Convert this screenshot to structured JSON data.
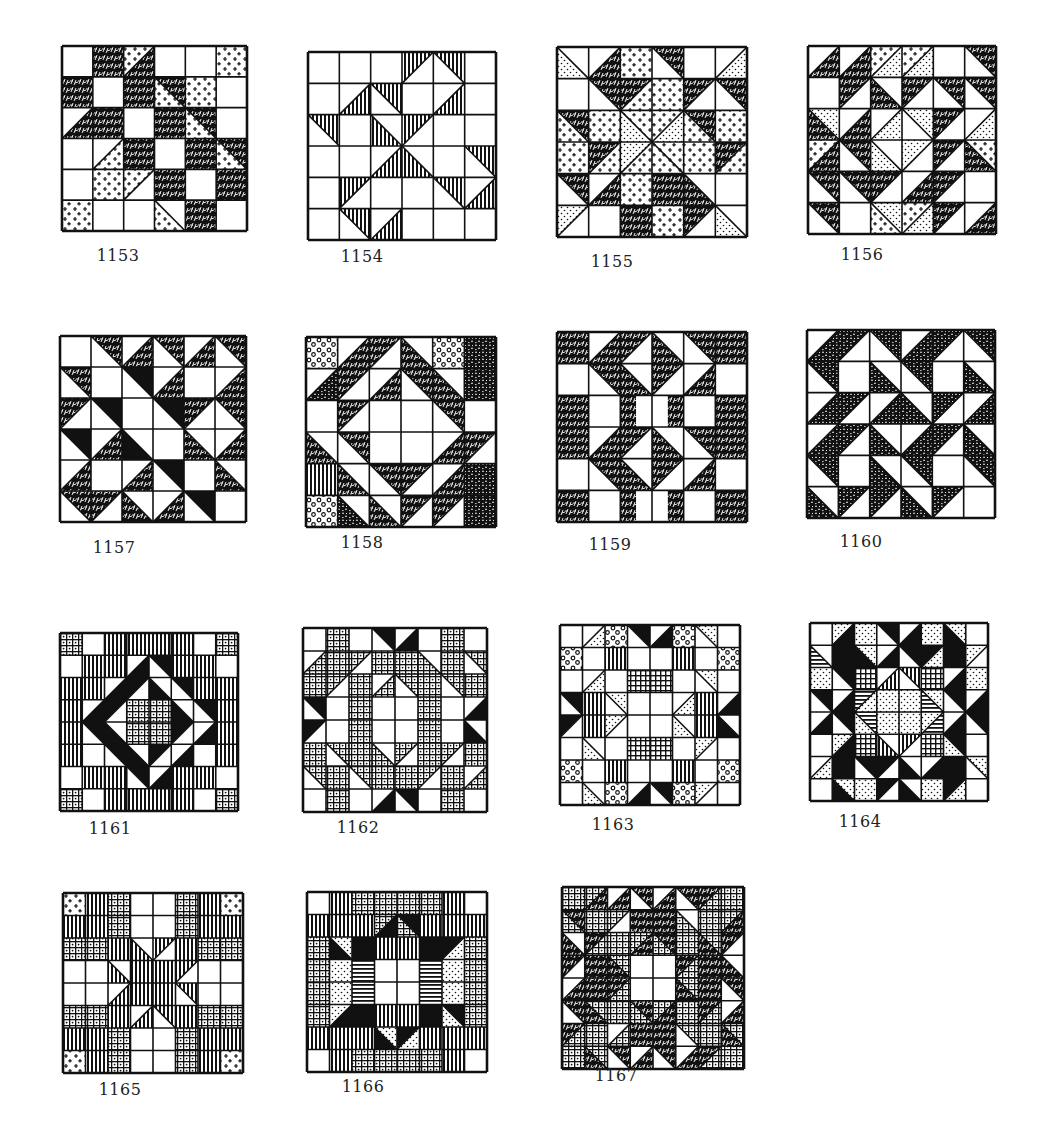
{
  "page": {
    "background": "#ffffff",
    "ink": "#111111"
  },
  "legend": {
    "W": "white",
    "K": "solid-black",
    "S": "scribble-dark-print",
    "C": "crosses-light-print",
    "D": "dots-light-print",
    "V": "vertical-stripes",
    "H": "horizontal-stripes",
    "G": "grid-check-print",
    "R": "dense-dot-grid-print",
    "O": "circles-print",
    "M": "mottled-dark-print"
  },
  "blocks": [
    {
      "id": "1153",
      "label": "1153",
      "x": 62,
      "y": 46,
      "size": 185,
      "n": 6,
      "cells": [
        [
          "W",
          "S",
          "C/S",
          "W",
          "W",
          "C"
        ],
        [
          "S",
          "W",
          "S",
          "S\\C",
          "C",
          "W"
        ],
        [
          "W/S",
          "S",
          "W",
          "S",
          "S\\C",
          "W"
        ],
        [
          "W",
          "W/C",
          "S",
          "W",
          "S",
          "S\\C"
        ],
        [
          "W",
          "C",
          "C/W",
          "S",
          "W",
          "S"
        ],
        [
          "C",
          "W",
          "W",
          "W\\C",
          "S",
          "W"
        ]
      ]
    },
    {
      "id": "1154",
      "label": "1154",
      "x": 308,
      "y": 52,
      "size": 188,
      "n": 6,
      "cells": [
        [
          "W",
          "W",
          "W",
          "V/W",
          "V\\W",
          "W"
        ],
        [
          "W",
          "W/V",
          "V\\W",
          "W",
          "W/V",
          "W"
        ],
        [
          "V\\W",
          "W",
          "W\\V",
          "V/W",
          "W",
          "W"
        ],
        [
          "W",
          "W",
          "W/V",
          "W\\V",
          "W",
          "V\\W"
        ],
        [
          "W",
          "V/W",
          "W",
          "W",
          "V\\W",
          "W/V"
        ],
        [
          "W",
          "V\\W",
          "W/V",
          "W",
          "W",
          "W"
        ]
      ]
    },
    {
      "id": "1155",
      "label": "1155",
      "x": 557,
      "y": 47,
      "size": 190,
      "n": 6,
      "cells": [
        [
          "W\\D",
          "W/S",
          "C",
          "S\\W",
          "W",
          "W/D"
        ],
        [
          "W",
          "S\\W",
          "S/C",
          "C",
          "S/W",
          "S\\W"
        ],
        [
          "S\\C",
          "C",
          "C\\D",
          "C/D",
          "S\\C",
          "C"
        ],
        [
          "C",
          "S/C",
          "D/C",
          "C\\C",
          "C",
          "S/C"
        ],
        [
          "S\\W",
          "W/S",
          "C",
          "S",
          "W\\S",
          "W"
        ],
        [
          "D/W",
          "W",
          "S",
          "C",
          "S/W",
          "W\\D"
        ]
      ]
    },
    {
      "id": "1156",
      "label": "1156",
      "x": 808,
      "y": 46,
      "size": 188,
      "n": 6,
      "cells": [
        [
          "W/S",
          "W/S",
          "C/D",
          "C/D",
          "W",
          "S\\W"
        ],
        [
          "W",
          "S/W",
          "W\\S",
          "S/W",
          "S\\W",
          "S\\W"
        ],
        [
          "D\\S",
          "W/S",
          "W/D",
          "D\\W",
          "S/W",
          "W/D"
        ],
        [
          "C/S",
          "S\\W",
          "W\\D",
          "D/W",
          "S/W",
          "C\\S"
        ],
        [
          "S\\W",
          "S\\W",
          "S/W",
          "W/S",
          "S/W",
          "W"
        ],
        [
          "S\\W",
          "W",
          "D\\C",
          "C/D",
          "S/W",
          "W/S"
        ]
      ]
    },
    {
      "id": "1157",
      "label": "1157",
      "x": 60,
      "y": 336,
      "size": 186,
      "n": 6,
      "cells": [
        [
          "W",
          "S\\W",
          "W/S",
          "S\\W",
          "W/S",
          "S\\W"
        ],
        [
          "S\\W",
          "W",
          "K\\W",
          "W/S",
          "W",
          "W/S"
        ],
        [
          "S/W",
          "K\\W",
          "W",
          "K\\W",
          "S/W",
          "S\\W"
        ],
        [
          "K\\W",
          "W/S",
          "W\\K",
          "W",
          "W\\S",
          "W/S"
        ],
        [
          "W/S",
          "W",
          "W/S",
          "K\\W",
          "W",
          "W\\S"
        ],
        [
          "S\\W",
          "S/W",
          "W\\S",
          "W/S",
          "K\\W",
          "W"
        ]
      ]
    },
    {
      "id": "1158",
      "label": "1158",
      "x": 306,
      "y": 337,
      "size": 190,
      "n": 6,
      "cells": [
        [
          "O",
          "W/S",
          "S/W",
          "W\\S",
          "O",
          "M"
        ],
        [
          "W/M",
          "S/W",
          "W/S",
          "S\\W",
          "W\\S",
          "M"
        ],
        [
          "W",
          "S/W",
          "W",
          "W",
          "S\\W",
          "W"
        ],
        [
          "W\\S",
          "S\\W",
          "W",
          "W",
          "W/S",
          "S/W"
        ],
        [
          "V",
          "W\\S",
          "S\\W",
          "S/W",
          "W/S",
          "M"
        ],
        [
          "O",
          "W\\M",
          "W\\S",
          "S/W",
          "S/W",
          "M"
        ]
      ]
    },
    {
      "id": "1159",
      "label": "1159",
      "x": 557,
      "y": 332,
      "size": 190,
      "n": 6,
      "cells": [
        [
          "S",
          "W/S",
          "S/W",
          "W\\S",
          "S\\W",
          "S"
        ],
        [
          "W",
          "S\\W",
          "W\\S",
          "S/W",
          "W/S",
          "W"
        ],
        [
          "S",
          "W",
          "S|W",
          "W|S",
          "W",
          "S"
        ],
        [
          "S",
          "W/S",
          "S/W",
          "W\\S",
          "S\\W",
          "S"
        ],
        [
          "W",
          "S\\W",
          "W\\S",
          "S/W",
          "W/S",
          "W"
        ],
        [
          "S",
          "W",
          "S|W",
          "W|S",
          "W",
          "S"
        ]
      ]
    },
    {
      "id": "1160",
      "label": "1160",
      "x": 807,
      "y": 330,
      "size": 188,
      "n": 6,
      "cells": [
        [
          "W/M",
          "M/W",
          "M\\W",
          "W/M",
          "M/W",
          "M\\W"
        ],
        [
          "M\\W",
          "W",
          "W\\M",
          "M\\W",
          "W",
          "W\\M"
        ],
        [
          "W/M",
          "M/W",
          "W/M",
          "W\\M",
          "M/W",
          "W/M"
        ],
        [
          "W/M",
          "M/W",
          "W\\M",
          "W/M",
          "M/W",
          "W\\M"
        ],
        [
          "M\\W",
          "W",
          "W\\M",
          "M\\W",
          "W",
          "M\\W"
        ],
        [
          "W\\M",
          "M/W",
          "M/W",
          "W\\M",
          "M/W",
          "W"
        ]
      ]
    },
    {
      "id": "1161",
      "label": "1161",
      "x": 60,
      "y": 633,
      "size": 178,
      "n": 8,
      "cells": [
        [
          "R",
          "W",
          "V",
          "V",
          "V",
          "V",
          "W",
          "R"
        ],
        [
          "W",
          "V",
          "V",
          "W/K",
          "K\\W",
          "V",
          "V",
          "W"
        ],
        [
          "V",
          "V",
          "W/K",
          "K/W",
          "W\\K",
          "K\\W",
          "V",
          "V"
        ],
        [
          "V",
          "W/K",
          "K/W",
          "R",
          "R",
          "W\\K",
          "K\\W",
          "V"
        ],
        [
          "V",
          "K\\W",
          "W\\K",
          "R",
          "R",
          "K/W",
          "W/K",
          "V"
        ],
        [
          "V",
          "W",
          "K\\W",
          "W\\K",
          "K/W",
          "W/K",
          "W",
          "V"
        ],
        [
          "W",
          "V",
          "V",
          "K\\W",
          "W/K",
          "V",
          "V",
          "W"
        ],
        [
          "R",
          "W",
          "V",
          "V",
          "V",
          "V",
          "W",
          "R"
        ]
      ]
    },
    {
      "id": "1162",
      "label": "1162",
      "x": 303,
      "y": 628,
      "size": 184,
      "n": 8,
      "cells": [
        [
          "W",
          "R",
          "W",
          "K\\W",
          "W/K",
          "W",
          "R",
          "W"
        ],
        [
          "W/R",
          "R",
          "R/W",
          "R",
          "R",
          "W\\R",
          "R",
          "R\\W"
        ],
        [
          "R",
          "R/W",
          "R",
          "W/R",
          "R\\W",
          "R",
          "R\\W",
          "R"
        ],
        [
          "K\\W",
          "W",
          "R",
          "W",
          "W",
          "R",
          "W",
          "W/K"
        ],
        [
          "K/W",
          "W",
          "R",
          "W",
          "W",
          "R",
          "W",
          "W\\K"
        ],
        [
          "R",
          "R\\W",
          "R",
          "W\\R",
          "R/W",
          "R",
          "R/W",
          "R"
        ],
        [
          "R\\W",
          "R",
          "R\\W",
          "R",
          "R",
          "R/W",
          "R",
          "W/R"
        ],
        [
          "W",
          "R",
          "W",
          "W/K",
          "K\\W",
          "W",
          "R",
          "W"
        ]
      ]
    },
    {
      "id": "1163",
      "label": "1163",
      "x": 560,
      "y": 625,
      "size": 180,
      "n": 8,
      "cells": [
        [
          "W",
          "W/D",
          "O",
          "K\\W",
          "W/K",
          "O",
          "D\\W",
          "W"
        ],
        [
          "O",
          "W",
          "V",
          "W",
          "W",
          "V",
          "W",
          "O"
        ],
        [
          "W",
          "W/D",
          "W",
          "G",
          "G",
          "W",
          "D\\W",
          "W"
        ],
        [
          "K\\W",
          "V",
          "D\\W",
          "W",
          "W",
          "W/D",
          "V",
          "W/K"
        ],
        [
          "K/W",
          "V",
          "D/W",
          "W",
          "W",
          "W\\D",
          "V",
          "W\\K"
        ],
        [
          "W",
          "W\\D",
          "W",
          "G",
          "G",
          "W",
          "D/W",
          "W"
        ],
        [
          "O",
          "W",
          "V",
          "W",
          "W",
          "V",
          "W",
          "O"
        ],
        [
          "W",
          "W\\D",
          "O",
          "W/K",
          "K\\W",
          "O",
          "D/W",
          "W"
        ]
      ]
    },
    {
      "id": "1164",
      "label": "1164",
      "x": 810,
      "y": 623,
      "size": 178,
      "n": 8,
      "cells": [
        [
          "W",
          "D/K",
          "D",
          "K\\W",
          "W/K",
          "D",
          "D\\K",
          "W"
        ],
        [
          "W\\H",
          "K",
          "D\\K",
          "W/K",
          "K\\W",
          "K/D",
          "K",
          "D/W"
        ],
        [
          "D",
          "K\\W",
          "G",
          "W/V",
          "V\\W",
          "G",
          "W/K",
          "D"
        ],
        [
          "K\\W",
          "W/K",
          "H/D",
          "D",
          "D",
          "D\\H",
          "K\\W",
          "W/K"
        ],
        [
          "W/K",
          "K\\W",
          "H\\D",
          "D",
          "D",
          "D/H",
          "W/K",
          "K\\W"
        ],
        [
          "W",
          "D/K",
          "G",
          "W\\V",
          "V/W",
          "G",
          "K\\D",
          "W"
        ],
        [
          "W/D",
          "K",
          "K\\W",
          "K/W",
          "W\\K",
          "W/K",
          "K",
          "D\\W"
        ],
        [
          "W",
          "D\\K",
          "D",
          "K/W",
          "W\\K",
          "D",
          "K/D",
          "W"
        ]
      ]
    },
    {
      "id": "1165",
      "label": "1165",
      "x": 63,
      "y": 893,
      "size": 180,
      "n": 8,
      "cells": [
        [
          "C",
          "V",
          "R",
          "W",
          "W",
          "R",
          "V",
          "C"
        ],
        [
          "V",
          "V",
          "R",
          "W",
          "W",
          "R",
          "V",
          "V"
        ],
        [
          "R",
          "R",
          "V",
          "W\\V",
          "V/W",
          "V",
          "R",
          "R"
        ],
        [
          "W",
          "W",
          "W\\V",
          "V",
          "V",
          "V/W",
          "W",
          "W"
        ],
        [
          "W",
          "W",
          "W/V",
          "V",
          "V",
          "V\\W",
          "W",
          "W"
        ],
        [
          "R",
          "R",
          "V",
          "W/V",
          "V\\W",
          "V",
          "R",
          "R"
        ],
        [
          "V",
          "V",
          "R",
          "W",
          "W",
          "R",
          "V",
          "V"
        ],
        [
          "C",
          "V",
          "R",
          "W",
          "W",
          "R",
          "V",
          "C"
        ]
      ]
    },
    {
      "id": "1166",
      "label": "1166",
      "x": 307,
      "y": 892,
      "size": 180,
      "n": 8,
      "cells": [
        [
          "W",
          "V",
          "R",
          "R",
          "R",
          "R",
          "V",
          "W"
        ],
        [
          "V",
          "V",
          "V",
          "R/K",
          "K\\R",
          "V",
          "V",
          "V"
        ],
        [
          "R",
          "D\\K",
          "K",
          "V",
          "V",
          "K",
          "K/D",
          "R"
        ],
        [
          "R",
          "D",
          "H",
          "W",
          "W",
          "H",
          "D",
          "R"
        ],
        [
          "R",
          "D",
          "H",
          "W",
          "W",
          "H",
          "D",
          "R"
        ],
        [
          "R",
          "D/K",
          "K",
          "V",
          "V",
          "K",
          "K\\D",
          "R"
        ],
        [
          "V",
          "V",
          "V",
          "D\\K",
          "K/D",
          "V",
          "V",
          "V"
        ],
        [
          "W",
          "V",
          "R",
          "R",
          "R",
          "R",
          "V",
          "W"
        ]
      ]
    },
    {
      "id": "1167",
      "label": "1167",
      "x": 562,
      "y": 887,
      "size": 182,
      "n": 8,
      "cells": [
        [
          "R",
          "R/S",
          "W/S",
          "S\\W",
          "W/S",
          "S\\W",
          "S/R",
          "R"
        ],
        [
          "S\\R",
          "R",
          "R/W",
          "S",
          "S",
          "W\\R",
          "R",
          "R/S"
        ],
        [
          "W\\S",
          "S/R",
          "R",
          "R/S",
          "S\\R",
          "R",
          "R\\S",
          "S/W"
        ],
        [
          "S/W",
          "S",
          "R\\S",
          "W",
          "W",
          "S/R",
          "S",
          "W\\S"
        ],
        [
          "W/S",
          "S",
          "S/R",
          "W",
          "W",
          "R\\S",
          "S",
          "S\\W"
        ],
        [
          "S\\W",
          "R\\S",
          "R",
          "S\\R",
          "R/S",
          "R",
          "S/R",
          "W/S"
        ],
        [
          "S/R",
          "R",
          "W/R",
          "S",
          "S",
          "R\\W",
          "R",
          "R\\S"
        ],
        [
          "R",
          "R\\S",
          "S\\W",
          "W/S",
          "S\\W",
          "W/S",
          "S/R",
          "R"
        ]
      ]
    }
  ],
  "captions": {
    "1153": "1153",
    "1154": "1154",
    "1155": "1155",
    "1156": "1156",
    "1157": "1157",
    "1158": "1158",
    "1159": "1159",
    "1160": "1160",
    "1161": "1161",
    "1162": "1162",
    "1163": "1163",
    "1164": "1164",
    "1165": "1165",
    "1166": "1166",
    "1167": "1167"
  },
  "caption_positions": {
    "1153": [
      98,
      246
    ],
    "1154": [
      342,
      247
    ],
    "1155": [
      592,
      252
    ],
    "1156": [
      842,
      245
    ],
    "1157": [
      94,
      538
    ],
    "1158": [
      342,
      533
    ],
    "1159": [
      590,
      535
    ],
    "1160": [
      841,
      532
    ],
    "1161": [
      90,
      819
    ],
    "1162": [
      338,
      818
    ],
    "1163": [
      593,
      815
    ],
    "1164": [
      840,
      812
    ],
    "1165": [
      100,
      1080
    ],
    "1166": [
      343,
      1077
    ],
    "1167": [
      596,
      1066
    ]
  }
}
